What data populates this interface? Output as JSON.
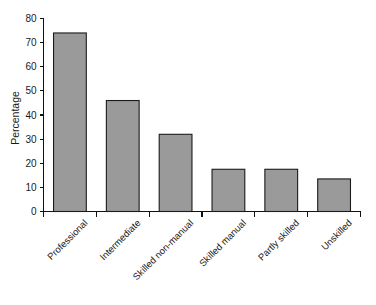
{
  "chart_data": {
    "type": "bar",
    "title": "",
    "subtitle": "",
    "xlabel": "",
    "ylabel": "Percentage",
    "categories": [
      "Professional",
      "Intermediate",
      "Skilled non-manual",
      "Skilled manual",
      "Partly skilled",
      "Unskilled"
    ],
    "values": [
      74,
      46,
      32,
      17.5,
      17.5,
      13.5
    ],
    "ylim": [
      0,
      80
    ],
    "ytick_step": 10,
    "ytick_labels": [
      "0",
      "10",
      "20",
      "30",
      "40",
      "50",
      "60",
      "70",
      "80"
    ],
    "grid": false,
    "legend": false,
    "legend_position": "none",
    "bar_fill_color": "#9a9a9a",
    "bar_edge_color": "#1b1b1b",
    "axis_color": "#111111",
    "background_color": "#ffffff",
    "xtick_label_rotation": 45
  }
}
